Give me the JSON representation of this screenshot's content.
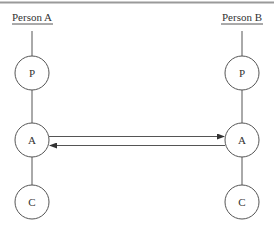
{
  "diagram": {
    "top_rule_color": "#9a9a9a",
    "line_color": "#555555",
    "text_color": "#333333",
    "lanes": [
      {
        "id": "a",
        "title": "Person A",
        "x": 32,
        "nodes": [
          {
            "label": "P",
            "y": 73
          },
          {
            "label": "A",
            "y": 140
          },
          {
            "label": "C",
            "y": 202
          }
        ]
      },
      {
        "id": "b",
        "title": "Person B",
        "x": 242,
        "nodes": [
          {
            "label": "P",
            "y": 73
          },
          {
            "label": "A",
            "y": 140
          },
          {
            "label": "C",
            "y": 202
          }
        ]
      }
    ],
    "arrows": [
      {
        "from": "Person A.A",
        "to": "Person B.A",
        "direction": "right",
        "y": 136
      },
      {
        "from": "Person B.A",
        "to": "Person A.A",
        "direction": "left",
        "y": 145
      }
    ]
  }
}
